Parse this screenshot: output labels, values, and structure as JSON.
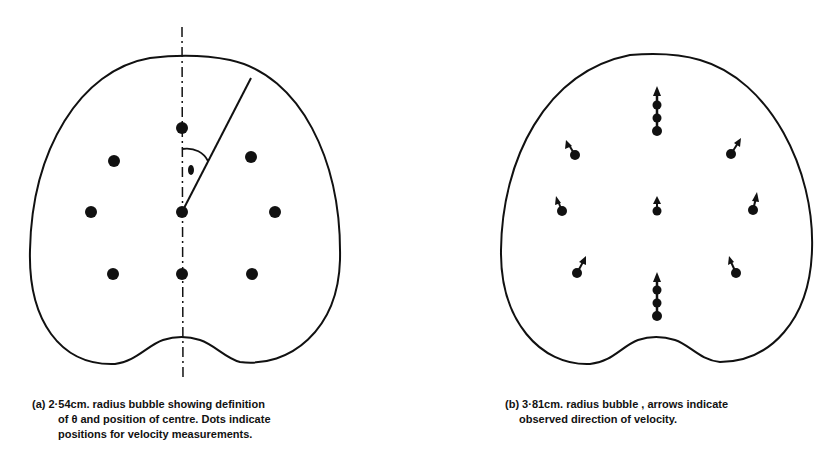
{
  "figure": {
    "panel_a": {
      "label": "(a)",
      "caption_lines": [
        "(a) 2·54cm. radius bubble showing definition",
        "of θ and position of centre. Dots indicate",
        "positions for velocity measurements."
      ],
      "angle_symbol": "θ",
      "measurement_points": [
        {
          "x": 182,
          "y": 128
        },
        {
          "x": 114,
          "y": 161
        },
        {
          "x": 251,
          "y": 157
        },
        {
          "x": 91,
          "y": 212
        },
        {
          "x": 182,
          "y": 212
        },
        {
          "x": 275,
          "y": 212
        },
        {
          "x": 113,
          "y": 274
        },
        {
          "x": 182,
          "y": 274
        },
        {
          "x": 252,
          "y": 274
        }
      ]
    },
    "panel_b": {
      "label": "(b)",
      "caption_lines": [
        "(b) 3·81cm. radius bubble , arrows indicate",
        "observed direction of velocity."
      ]
    },
    "colors": {
      "ink": "#111111",
      "background": "#ffffff"
    }
  }
}
